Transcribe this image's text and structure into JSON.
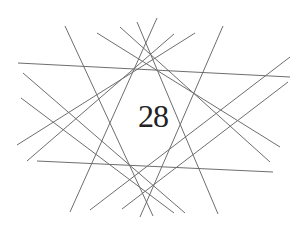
{
  "diagram": {
    "center_label": "28",
    "line_color": "#6e6e6e",
    "text_color": "#222222",
    "background": "#ffffff",
    "lines": [
      {
        "x1": 18,
        "y1": 63,
        "x2": 290,
        "y2": 77
      },
      {
        "x1": 37,
        "y1": 161,
        "x2": 273,
        "y2": 172
      },
      {
        "x1": 65,
        "y1": 26,
        "x2": 153,
        "y2": 216
      },
      {
        "x1": 223,
        "y1": 26,
        "x2": 140,
        "y2": 217
      },
      {
        "x1": 97,
        "y1": 33,
        "x2": 280,
        "y2": 147
      },
      {
        "x1": 120,
        "y1": 27,
        "x2": 270,
        "y2": 162
      },
      {
        "x1": 137,
        "y1": 22,
        "x2": 218,
        "y2": 214
      },
      {
        "x1": 157,
        "y1": 18,
        "x2": 70,
        "y2": 212
      },
      {
        "x1": 195,
        "y1": 33,
        "x2": 17,
        "y2": 145
      },
      {
        "x1": 174,
        "y1": 34,
        "x2": 27,
        "y2": 161
      },
      {
        "x1": 23,
        "y1": 73,
        "x2": 185,
        "y2": 213
      },
      {
        "x1": 21,
        "y1": 98,
        "x2": 174,
        "y2": 213
      },
      {
        "x1": 290,
        "y1": 57,
        "x2": 90,
        "y2": 210
      },
      {
        "x1": 288,
        "y1": 82,
        "x2": 122,
        "y2": 209
      }
    ]
  }
}
